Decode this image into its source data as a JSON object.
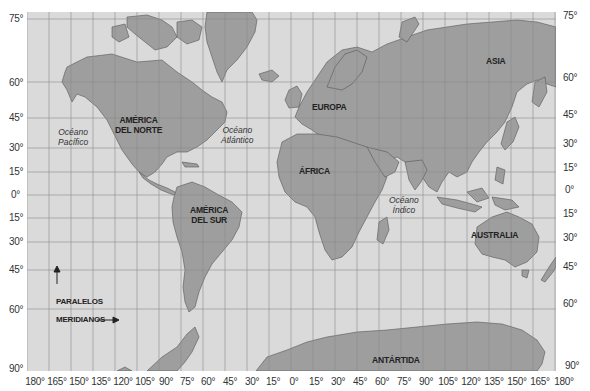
{
  "map": {
    "colors": {
      "ocean": "#dadada",
      "land": "#9e9e9e",
      "coast": "#555555",
      "grid": "#8a8a8a"
    },
    "latitude_labels_left": [
      {
        "label": "75°",
        "y": 13
      },
      {
        "label": "60°",
        "y": 77
      },
      {
        "label": "45°",
        "y": 112
      },
      {
        "label": "30°",
        "y": 142
      },
      {
        "label": "15°",
        "y": 166
      },
      {
        "label": "0°",
        "y": 189
      },
      {
        "label": "15°",
        "y": 212
      },
      {
        "label": "30°",
        "y": 236
      },
      {
        "label": "45°",
        "y": 264
      },
      {
        "label": "60°",
        "y": 304
      },
      {
        "label": "90°",
        "y": 363
      }
    ],
    "latitude_labels_right": [
      {
        "label": "75°",
        "y": 10
      },
      {
        "label": "60°",
        "y": 72
      },
      {
        "label": "45°",
        "y": 109
      },
      {
        "label": "30°",
        "y": 138
      },
      {
        "label": "15°",
        "y": 162
      },
      {
        "label": "0°",
        "y": 184
      },
      {
        "label": "15°",
        "y": 208
      },
      {
        "label": "30°",
        "y": 232
      },
      {
        "label": "45°",
        "y": 261
      },
      {
        "label": "60°",
        "y": 298
      },
      {
        "label": "90°",
        "y": 360
      }
    ],
    "longitude_labels": [
      "180°",
      "165°",
      "150°",
      "135°",
      "120°",
      "105°",
      "90°",
      "75°",
      "60°",
      "45°",
      "30°",
      "15°",
      "0°",
      "15°",
      "30°",
      "45°",
      "60°",
      "75°",
      "90°",
      "105°",
      "120°",
      "135°",
      "150°",
      "165°",
      "180°"
    ],
    "continents": {
      "north_america": "AMÉRICA\nDEL NORTE",
      "south_america": "AMÉRICA\nDEL SUR",
      "europe": "EUROPA",
      "africa": "ÁFRICA",
      "asia": "ASIA",
      "australia": "AUSTRALIA",
      "antarctica": "ANTÁRTIDA"
    },
    "oceans": {
      "pacific": "Océano\nPacífico",
      "atlantic": "Océano\nAtlántico",
      "indian": "Océano\nÍndico"
    },
    "legend": {
      "parallels": "PARALELOS",
      "meridians": "MERIDIANOS"
    }
  }
}
